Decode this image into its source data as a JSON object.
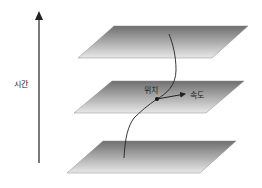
{
  "diagram": {
    "axis": {
      "label": "시간",
      "direction": "up"
    },
    "planes": [
      {
        "id": "top-plane",
        "points": [
          [
            114,
            26
          ],
          [
            248,
            26
          ],
          [
            212,
            58
          ],
          [
            78,
            58
          ]
        ]
      },
      {
        "id": "middle-plane",
        "points": [
          [
            112,
            81
          ],
          [
            244,
            81
          ],
          [
            206,
            113
          ],
          [
            74,
            113
          ]
        ]
      },
      {
        "id": "bottom-plane",
        "points": [
          [
            103,
            141
          ],
          [
            236,
            141
          ],
          [
            200,
            173
          ],
          [
            67,
            173
          ]
        ]
      }
    ],
    "labels": {
      "position": "위치",
      "velocity": "속도"
    },
    "colors": {
      "plane_dark": "#6f6f6f",
      "plane_light": "#e6e6e6",
      "line": "#222222"
    }
  }
}
